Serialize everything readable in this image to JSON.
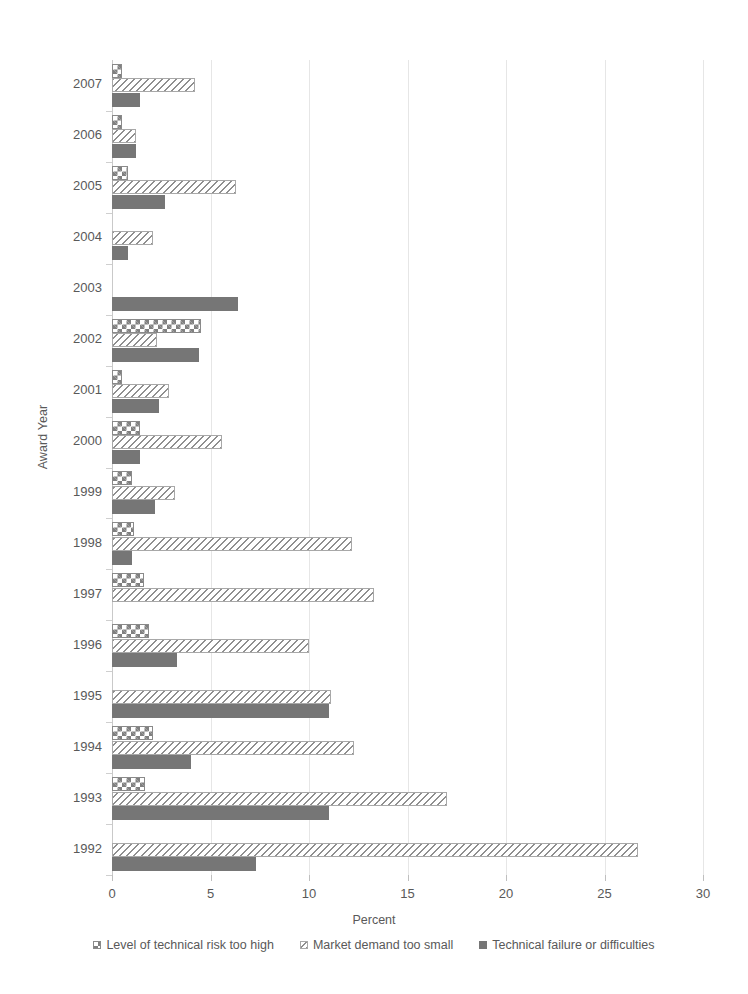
{
  "chart_data": {
    "type": "bar",
    "orientation": "horizontal",
    "title": "",
    "xlabel": "Percent",
    "ylabel": "Award Year",
    "xlim": [
      0,
      30
    ],
    "xticks": [
      0,
      5,
      10,
      15,
      20,
      25,
      30
    ],
    "grid": true,
    "legend_position": "bottom",
    "categories": [
      "2007",
      "2006",
      "2005",
      "2004",
      "2003",
      "2002",
      "2001",
      "2000",
      "1999",
      "1998",
      "1997",
      "1996",
      "1995",
      "1994",
      "1993",
      "1992"
    ],
    "series": [
      {
        "name": "Level of technical risk too high",
        "pattern": "checkerboard",
        "color": "#808080",
        "values": [
          0.5,
          0.5,
          0.8,
          0.0,
          0.0,
          4.5,
          0.5,
          1.4,
          1.0,
          1.1,
          1.6,
          1.9,
          0.0,
          2.1,
          1.7,
          0.0
        ]
      },
      {
        "name": "Market demand too small",
        "pattern": "diagonal-hatch",
        "color": "#8f8f8f",
        "values": [
          4.2,
          1.2,
          6.3,
          2.1,
          0.0,
          2.3,
          2.9,
          5.6,
          3.2,
          12.2,
          13.3,
          10.0,
          11.1,
          12.3,
          17.0,
          26.7
        ]
      },
      {
        "name": "Technical failure or difficulties",
        "pattern": "solid",
        "color": "#767676",
        "values": [
          1.4,
          1.2,
          2.7,
          0.8,
          6.4,
          4.4,
          2.4,
          1.4,
          2.2,
          1.0,
          0.0,
          3.3,
          11.0,
          4.0,
          11.0,
          7.3
        ]
      }
    ]
  },
  "axis": {
    "y_title": "Award Year",
    "x_title": "Percent"
  }
}
